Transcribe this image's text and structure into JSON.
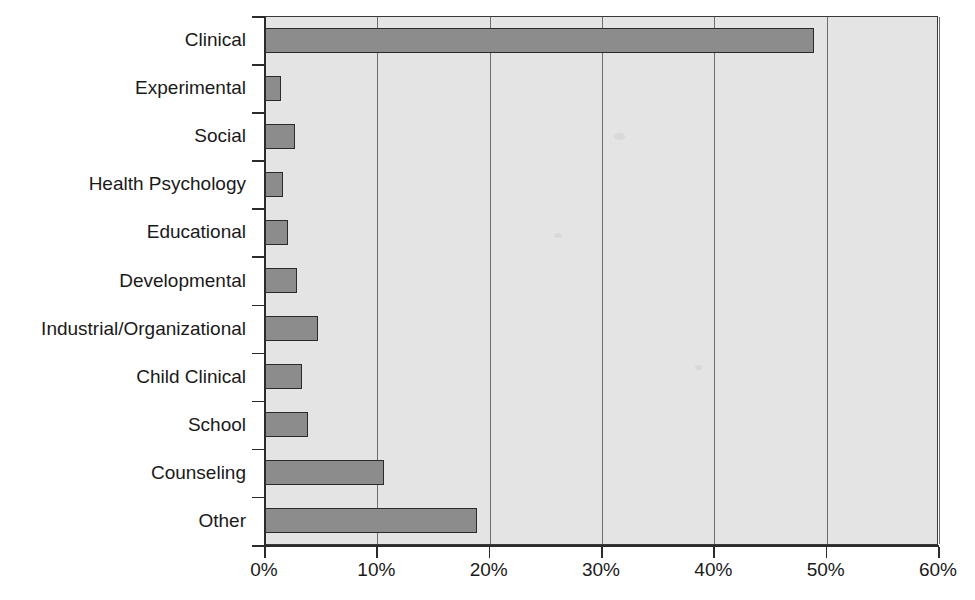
{
  "chart_data": {
    "type": "bar",
    "orientation": "horizontal",
    "title": "",
    "subtitle": "",
    "xlabel": "",
    "ylabel": "",
    "xlim": [
      0,
      60
    ],
    "ylim": null,
    "grid": true,
    "legend": null,
    "legend_position": "none",
    "tick_suffix": "%",
    "xticks": [
      0,
      10,
      20,
      30,
      40,
      50,
      60
    ],
    "xtick_labels": [
      "0%",
      "10%",
      "20%",
      "30%",
      "40%",
      "50%",
      "60%"
    ],
    "categories": [
      "Clinical",
      "Experimental",
      "Social",
      "Health Psychology",
      "Educational",
      "Developmental",
      "Industrial/Organizational",
      "Child Clinical",
      "School",
      "Counseling",
      "Other"
    ],
    "values": [
      49.0,
      1.5,
      2.8,
      1.7,
      2.1,
      2.9,
      4.8,
      3.4,
      3.9,
      10.7,
      19.0
    ],
    "series": [
      {
        "name": "Percent of respondents",
        "values": [
          49.0,
          1.5,
          2.8,
          1.7,
          2.1,
          2.9,
          4.8,
          3.4,
          3.9,
          10.7,
          19.0
        ]
      }
    ],
    "colors": {
      "bar_fill": "#8c8c8c",
      "bar_border": "#2b2b2b",
      "plot_background": "#e4e4e4",
      "gridline": "#6e6e6e",
      "axis": "#2b2b2b",
      "text": "#1a1a1a",
      "page_background": "#ffffff"
    }
  }
}
